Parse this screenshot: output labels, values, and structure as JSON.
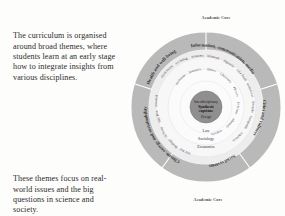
{
  "body_text": {
    "paragraph_top": "The curriculum is organised around broad themes, where students learn at an early stage how to integrate insights from various disciplines.",
    "paragraph_bottom": "These themes focus on real-world issues and the big questions in science and society."
  },
  "diagram": {
    "caption_top": "Academic Core",
    "caption_bottom": "Academic Core",
    "center": {
      "line1": "Interdisciplinary",
      "line2": "Synthesis",
      "line3": "capstone",
      "line4": "Design"
    },
    "outer_ring_segments": [
      {
        "label": "Health and well-being"
      },
      {
        "label": "Information, communication, media"
      },
      {
        "label": "Cities and cultures"
      },
      {
        "label": "Social systems"
      },
      {
        "label": "Climate, energy and sustainability"
      }
    ],
    "disciplines_ring_outer": [
      "Medical Sciences",
      "Psychology",
      "Neuroscience",
      "Philosophy",
      "Linguistics",
      "Media Studies",
      "Communication",
      "Anthropology",
      "Geography",
      "Architecture",
      "History",
      "Political science",
      "Economics",
      "Sociology",
      "Law",
      "Public Health",
      "Environmental science",
      "Earth Sciences",
      "Biology",
      "Public Policy"
    ],
    "disciplines_ring_inner": [
      "Data Science",
      "Statistics",
      "Ethics",
      "Chemistry",
      "Physics",
      "Life Sciences",
      "Mathematics",
      "Computing"
    ],
    "colors": {
      "outer_ring": "#b9b9b9",
      "mid_ring": "#ededed",
      "inner_disc": "#f5f5f5",
      "core": "#8f8f8f",
      "core_text": "#1c1c1c",
      "text": "#3d3d3d",
      "divider": "#ffffff"
    }
  }
}
